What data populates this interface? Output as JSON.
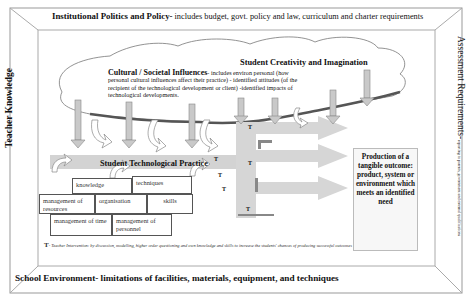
{
  "frame": {
    "top": {
      "title": "Institutional Politics and Policy-",
      "detail": " includes budget, govt. policy and law, curriculum and charter requirements"
    },
    "bottom": {
      "title": "School Environment- limitations of facilities, materials, equipment, and techniques"
    },
    "left": {
      "title": "Teacher Knowledge"
    },
    "right": {
      "title": "Assessment Requirements-",
      "detail": " reporting to parents, government and external qualifications"
    }
  },
  "cloud": {
    "cultural_title": "Cultural / Societal Influences",
    "cultural_text": "- includes environ personal (how personal cultural influences affect their practice) - identified attitudes (of the recipient of the technological development or client) -identified impacts of technological developments.",
    "creativity_title": "Student Creativity and Imagination"
  },
  "practice": {
    "title": "Student Technological Practice",
    "boxes": [
      {
        "label": "knowledge"
      },
      {
        "label": "techniques"
      },
      {
        "label": "management of resources"
      },
      {
        "label": "organisation"
      },
      {
        "label": "skills"
      },
      {
        "label": "management of time"
      },
      {
        "label": "management of personnel"
      }
    ]
  },
  "interventions": {
    "marker": "T",
    "count": 6
  },
  "outcome": {
    "text": "Production of a tangible outcome: product, system or environment which meets an identified need"
  },
  "footnote": {
    "marker": "T",
    "text": "- Teacher Intervention: by discussion, modelling, higher order questioning and own knowledge and skills to increase the students' chances of producing successful outcomes"
  },
  "colors": {
    "arrow_fill": "#c9c9c9",
    "arrow_stroke": "#8a8a8a",
    "band_fill": "#d4d4d4",
    "frame_line": "#999999"
  }
}
